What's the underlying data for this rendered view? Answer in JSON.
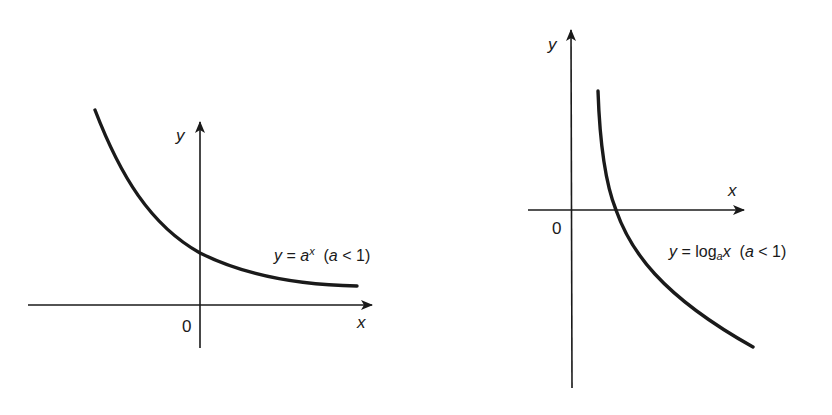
{
  "figure": {
    "colors": {
      "ink": "#1a1a1a",
      "background": "#ffffff"
    },
    "left_graph": {
      "name": "exponential",
      "y_axis_label": "y",
      "x_axis_label": "x",
      "origin_label": "0",
      "equation": {
        "lhs": "y",
        "equals": " = ",
        "base": "a",
        "exponent": "x",
        "condition_open": "  (",
        "condition_var": "a",
        "condition_rest": " < 1)"
      },
      "equation_text": "y = a^x (a < 1)"
    },
    "right_graph": {
      "name": "logarithmic",
      "y_axis_label": "y",
      "x_axis_label": "x",
      "origin_label": "0",
      "equation": {
        "lhs": "y",
        "equals": " = log",
        "base": "a",
        "arg": "x",
        "condition_open": "  (",
        "condition_var": "a",
        "condition_rest": " < 1)"
      },
      "equation_text": "y = log_a x (a < 1)"
    }
  }
}
